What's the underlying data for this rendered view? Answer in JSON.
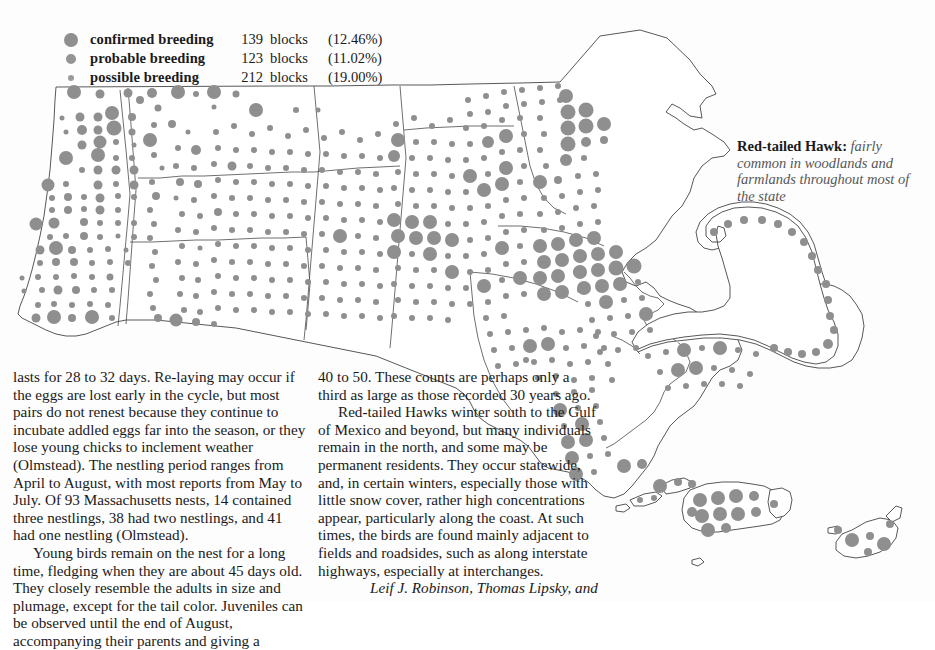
{
  "legend": {
    "rows": [
      {
        "swatch": "large-gray-dot",
        "label": "confirmed breeding",
        "count": "139",
        "unit": "blocks",
        "percent": "(12.46%)"
      },
      {
        "swatch": "medium-gray-dot",
        "label": "probable breeding",
        "count": "123",
        "unit": "blocks",
        "percent": "(11.02%)"
      },
      {
        "swatch": "small-gray-dot",
        "label": "possible breeding",
        "count": "212",
        "unit": "blocks",
        "percent": "(19.00%)"
      }
    ]
  },
  "caption": {
    "species": "Red-tailed Hawk:",
    "description": " fairly common in woodlands and farmlands throughout most of the state"
  },
  "map": {
    "region": "Massachusetts",
    "dot_color": "#8f8f8f",
    "outline_color": "#3a3a3a",
    "background": "#ffffff"
  },
  "body_text": {
    "column_1": [
      "lasts for 28 to 32 days. Re-laying may occur if the eggs are lost early in the cycle, but most pairs do not renest because they continue to incubate addled eggs far into the season, or they lose young chicks to inclement weather (Olmstead). The nestling period ranges from April to August, with most reports from May to July. Of 93 Massachusetts nests, 14 contained three nestlings, 38 had two nestlings, and 41 had one nestling (Olmstead).",
      "Young birds remain on the nest for a long time, fledging when they are about 45 days old. They closely resemble the adults in size and plumage, except for the tail color. Juveniles can be observed until the end of August, accompanying their parents and giving a"
    ],
    "column_2": [
      "40 to 50. These counts are perhaps only a third as large as those recorded 30 years ago.",
      "Red-tailed Hawks winter south to the Gulf of Mexico and beyond, but many individuals remain in the north, and some may be permanent residents. They occur statewide, and, in certain winters, especially those with little snow cover, rather high concentrations appear, particularly along the coast. At such times, the birds are found mainly adjacent to fields and roadsides, such as along interstate highways, especially at interchanges."
    ],
    "byline": "Leif J. Robinson, Thomas Lipsky, and"
  }
}
